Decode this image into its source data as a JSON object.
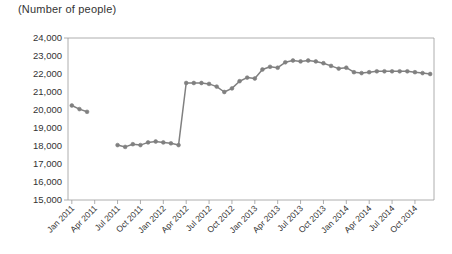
{
  "chart_data": {
    "type": "line",
    "title": "(Number of people)",
    "xlabel": "",
    "ylabel": "",
    "ylim": [
      15000,
      24000
    ],
    "ytick_step": 1000,
    "yticks": [
      24000,
      23000,
      22000,
      21000,
      20000,
      19000,
      18000,
      17000,
      16000,
      15000
    ],
    "ytick_labels": [
      "24,000",
      "23,000",
      "22,000",
      "21,000",
      "20,000",
      "19,000",
      "18,000",
      "17,000",
      "16,000",
      "15,000"
    ],
    "xticks": [
      "Jan 2011",
      "Apr 2011",
      "Jul 2011",
      "Oct 2011",
      "Jan 2012",
      "Apr 2012",
      "Jul 2012",
      "Oct 2012",
      "Jan 2013",
      "Apr 2013",
      "Jul 2013",
      "Oct 2013",
      "Jan 2014",
      "Apr 2014",
      "Jul 2014",
      "Oct 2014"
    ],
    "grid": false,
    "legend": "none",
    "line_color": "#808080",
    "marker_color": "#808080",
    "axis_color": "#999999",
    "x": [
      "Jan 2011",
      "Feb 2011",
      "Mar 2011",
      "Apr 2011",
      "May 2011",
      "Jun 2011",
      "Jul 2011",
      "Aug 2011",
      "Sep 2011",
      "Oct 2011",
      "Nov 2011",
      "Dec 2011",
      "Jan 2012",
      "Feb 2012",
      "Mar 2012",
      "Apr 2012",
      "May 2012",
      "Jun 2012",
      "Jul 2012",
      "Aug 2012",
      "Sep 2012",
      "Oct 2012",
      "Nov 2012",
      "Dec 2012",
      "Jan 2013",
      "Feb 2013",
      "Mar 2013",
      "Apr 2013",
      "May 2013",
      "Jun 2013",
      "Jul 2013",
      "Aug 2013",
      "Sep 2013",
      "Oct 2013",
      "Nov 2013",
      "Dec 2013",
      "Jan 2014",
      "Feb 2014",
      "Mar 2014",
      "Apr 2014",
      "May 2014",
      "Jun 2014",
      "Jul 2014",
      "Aug 2014",
      "Sep 2014",
      "Oct 2014",
      "Nov 2014",
      "Dec 2014"
    ],
    "values": [
      20250,
      20050,
      19900,
      null,
      null,
      null,
      18050,
      17950,
      18100,
      18050,
      18200,
      18250,
      18200,
      18150,
      18050,
      21500,
      21500,
      21500,
      21450,
      21300,
      21000,
      21200,
      21600,
      21800,
      21750,
      22250,
      22400,
      22350,
      22650,
      22750,
      22700,
      22750,
      22700,
      22600,
      22450,
      22300,
      22350,
      22100,
      22050,
      22100,
      22150,
      22150,
      22150,
      22150,
      22150,
      22100,
      22050,
      22000
    ],
    "series_name": "Number of people"
  }
}
